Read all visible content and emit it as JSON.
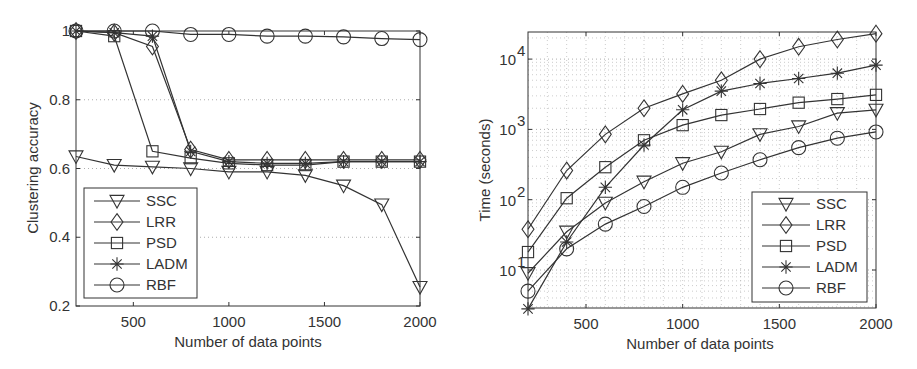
{
  "chart_data": [
    {
      "type": "line",
      "title": "",
      "xlabel": "Number of data points",
      "ylabel": "Clustering accuracy",
      "x": [
        200,
        400,
        600,
        800,
        1000,
        1200,
        1400,
        1600,
        1800,
        2000
      ],
      "xticks": [
        "500",
        "1000",
        "1500",
        "2000"
      ],
      "yticks": [
        "0.2",
        "0.4",
        "0.6",
        "0.8",
        "1"
      ],
      "xlim": [
        200,
        2000
      ],
      "ylim": [
        0.2,
        1.0
      ],
      "grid": "horizontal dotted",
      "legend_position": "lower left",
      "series": [
        {
          "name": "SSC",
          "marker": "triangle-down",
          "values": [
            0.635,
            0.61,
            0.605,
            0.6,
            0.59,
            0.59,
            0.58,
            0.55,
            0.495,
            0.255
          ]
        },
        {
          "name": "LRR",
          "marker": "diamond",
          "values": [
            1.0,
            0.995,
            0.955,
            0.655,
            0.625,
            0.625,
            0.625,
            0.625,
            0.625,
            0.625
          ]
        },
        {
          "name": "PSD",
          "marker": "square",
          "values": [
            1.0,
            0.985,
            0.65,
            0.63,
            0.615,
            0.61,
            0.61,
            0.62,
            0.62,
            0.62
          ]
        },
        {
          "name": "LADM",
          "marker": "asterisk",
          "values": [
            1.0,
            0.995,
            0.985,
            0.65,
            0.62,
            0.615,
            0.615,
            0.62,
            0.62,
            0.62
          ]
        },
        {
          "name": "RBF",
          "marker": "circle",
          "values": [
            1.0,
            1.0,
            1.0,
            0.99,
            0.99,
            0.985,
            0.985,
            0.983,
            0.978,
            0.975
          ]
        }
      ]
    },
    {
      "type": "line",
      "title": "",
      "xlabel": "Number of data points",
      "ylabel": "Time (seconds)",
      "yscale": "log",
      "x": [
        200,
        400,
        600,
        800,
        1000,
        1200,
        1400,
        1600,
        1800,
        2000
      ],
      "xticks": [
        "500",
        "1000",
        "1500",
        "2000"
      ],
      "yticks": [
        "10^1",
        "10^2",
        "10^3",
        "10^4"
      ],
      "xlim": [
        200,
        2000
      ],
      "ylim": [
        2.8,
        24000
      ],
      "grid": "both dotted, minor",
      "legend_position": "lower right",
      "series": [
        {
          "name": "SSC",
          "marker": "triangle-down",
          "values": [
            9,
            35,
            90,
            180,
            330,
            480,
            850,
            1100,
            1700,
            1900
          ]
        },
        {
          "name": "LRR",
          "marker": "diamond",
          "values": [
            38,
            260,
            850,
            2000,
            3200,
            5000,
            10000,
            15000,
            19000,
            23000
          ]
        },
        {
          "name": "PSD",
          "marker": "square",
          "values": [
            18,
            105,
            290,
            700,
            1150,
            1600,
            1950,
            2400,
            2700,
            3100
          ]
        },
        {
          "name": "LADM",
          "marker": "asterisk",
          "values": [
            2.8,
            25,
            150,
            600,
            1900,
            3500,
            4500,
            5300,
            6300,
            8200
          ]
        },
        {
          "name": "RBF",
          "marker": "circle",
          "values": [
            5,
            20,
            45,
            80,
            150,
            240,
            370,
            550,
            750,
            920
          ]
        }
      ]
    }
  ],
  "left": {
    "ylabel": "Clustering accuracy",
    "xlabel": "Number of data points",
    "yticks": [
      "0.2",
      "0.4",
      "0.6",
      "0.8",
      "1"
    ],
    "xticks": [
      "500",
      "1000",
      "1500",
      "2000"
    ],
    "legend": [
      "SSC",
      "LRR",
      "PSD",
      "LADM",
      "RBF"
    ]
  },
  "right": {
    "ylabel": "Time (seconds)",
    "xlabel": "Number of data points",
    "yticks": [
      "10",
      "10",
      "10",
      "10"
    ],
    "yexp": [
      "1",
      "2",
      "3",
      "4"
    ],
    "xticks": [
      "500",
      "1000",
      "1500",
      "2000"
    ],
    "legend": [
      "SSC",
      "LRR",
      "PSD",
      "LADM",
      "RBF"
    ]
  }
}
